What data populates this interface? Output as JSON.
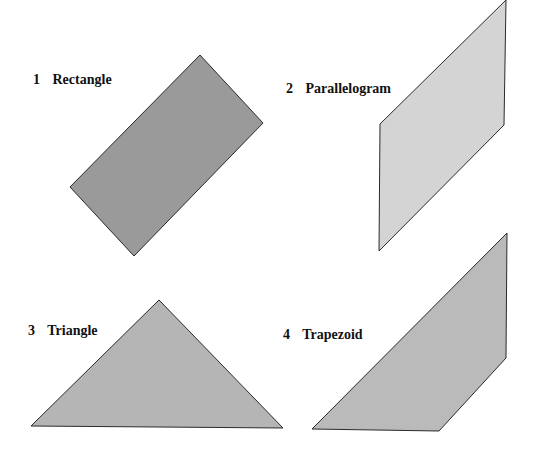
{
  "figure": {
    "shapes": [
      {
        "number": "1",
        "name": "Rectangle",
        "fill": "#9a9a9a",
        "points": "200,55 263,123 134,256 70,187",
        "label_pos": {
          "left": 33,
          "top": 73
        }
      },
      {
        "number": "2",
        "name": "Parallelogram",
        "fill": "#d4d4d4",
        "points": "380,124 506,0 504,125 379,251",
        "label_pos": {
          "left": 286,
          "top": 82
        }
      },
      {
        "number": "3",
        "name": "Triangle",
        "fill": "#b5b5b5",
        "points": "159,300 283,428 31,426",
        "label_pos": {
          "left": 28,
          "top": 324
        }
      },
      {
        "number": "4",
        "name": "Trapezoid",
        "fill": "#bababa",
        "points": "507,233 506,358 439,431 312,429",
        "label_pos": {
          "left": 283,
          "top": 328
        }
      }
    ]
  }
}
